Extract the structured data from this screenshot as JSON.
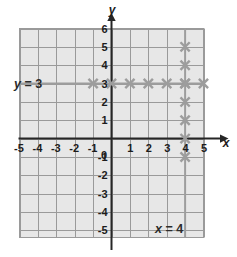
{
  "figure": {
    "background_color": "#ffffff",
    "plot_fill_color": "#e7e7e7",
    "grid_line_color": "#9a9a9a",
    "axis_color": "#262626",
    "graph_color": "#9d9d9d",
    "marker_color": "#9d9d9d"
  },
  "axes": {
    "x_axis_name": "x",
    "y_axis_name": "y",
    "x_tick_labels": [
      "-5",
      "-4",
      "-3",
      "-2",
      "-1",
      "1",
      "2",
      "3",
      "4",
      "5"
    ],
    "y_tick_labels": [
      "6",
      "5",
      "4",
      "3",
      "2",
      "1",
      "-1",
      "-2",
      "-3",
      "-4",
      "-5"
    ],
    "origin_label": "0",
    "xlim": [
      -5,
      5
    ],
    "ylim": [
      -5,
      6
    ]
  },
  "labels": {
    "horizontal_line_label": {
      "var": "y",
      "rest": " = 3"
    },
    "vertical_line_label": {
      "var": "x",
      "rest": " = 4"
    }
  },
  "chart_data": {
    "type": "scatter",
    "xlabel": "x",
    "ylabel": "y",
    "xlim": [
      -5,
      5
    ],
    "ylim": [
      -5,
      6
    ],
    "grid": true,
    "legend": "none",
    "xticks": [
      -5,
      -4,
      -3,
      -2,
      -1,
      0,
      1,
      2,
      3,
      4,
      5
    ],
    "yticks": [
      6,
      5,
      4,
      3,
      2,
      1,
      0,
      -1,
      -2,
      -3,
      -4,
      -5
    ],
    "annotations": [
      {
        "text": "y = 3",
        "x": -4.7,
        "y": 3.6
      },
      {
        "text": "x = 4",
        "x": 3.0,
        "y": -4.5
      }
    ],
    "series": [
      {
        "name": "y = 3",
        "type": "line",
        "equation": "y = 3",
        "orientation": "horizontal",
        "value": 3,
        "color": "#9d9d9d",
        "x": [
          -5,
          5
        ],
        "y": [
          3,
          3
        ],
        "marker": "x",
        "marker_points": [
          {
            "x": -1,
            "y": 3
          },
          {
            "x": 0,
            "y": 3
          },
          {
            "x": 1,
            "y": 3
          },
          {
            "x": 2,
            "y": 3
          },
          {
            "x": 3,
            "y": 3
          },
          {
            "x": 4,
            "y": 3
          },
          {
            "x": 5,
            "y": 3
          }
        ]
      },
      {
        "name": "x = 4",
        "type": "line",
        "equation": "x = 4",
        "orientation": "vertical",
        "value": 4,
        "color": "#9d9d9d",
        "x": [
          4,
          4
        ],
        "y": [
          -5.4,
          6
        ],
        "marker": "x",
        "marker_points": [
          {
            "x": 4,
            "y": 5
          },
          {
            "x": 4,
            "y": 4
          },
          {
            "x": 4,
            "y": 3
          },
          {
            "x": 4,
            "y": 2
          },
          {
            "x": 4,
            "y": 1
          },
          {
            "x": 4,
            "y": 0
          },
          {
            "x": 4,
            "y": -1
          }
        ]
      }
    ]
  }
}
